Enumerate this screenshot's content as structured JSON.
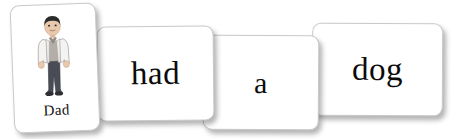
{
  "scene": {
    "title": "Sentence building flashcards",
    "sentence": "Dad had a dog",
    "background_color": "#ffffff",
    "card_color": "#ffffff",
    "card_border_color": "#c9c9c9",
    "text_color": "#0b0b0b"
  },
  "cards": [
    {
      "id": "card-dad",
      "type": "picture-word",
      "word": "Dad",
      "label": "Dad",
      "illustration": "man-standing-figure",
      "illustration_description": "Illustration of a man with dark hair wearing a light open jacket over a darker shirt, dark trousers and dark shoes",
      "colors": {
        "hair": "#2b2b2b",
        "skin": "#e8c9ae",
        "jacket": "#f2f1ef",
        "shirt": "#a9a49d",
        "trousers": "#4a4c55",
        "shoes": "#2e2e33"
      }
    },
    {
      "id": "card-had",
      "type": "word",
      "word": "had"
    },
    {
      "id": "card-a",
      "type": "word",
      "word": "a"
    },
    {
      "id": "card-dog",
      "type": "word",
      "word": "dog"
    }
  ]
}
